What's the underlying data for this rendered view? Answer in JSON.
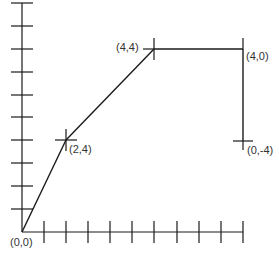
{
  "diagram": {
    "type": "coordinate path diagram",
    "axes": {
      "x_tick_count": 10,
      "y_tick_count": 10
    },
    "points": [
      {
        "label": "(0,0)",
        "role": "origin"
      },
      {
        "label": "(2,4)",
        "role": "vertex"
      },
      {
        "label": "(4,4)",
        "role": "vertex"
      },
      {
        "label": "(4,0)",
        "role": "vertex"
      },
      {
        "label": "(0,-4)",
        "role": "endpoint"
      }
    ],
    "path_order": [
      "(0,0)",
      "(2,4)",
      "(4,4)",
      "(4,0)",
      "(0,-4)"
    ],
    "line_color": "#1a1a1a",
    "label_color": "#333333"
  }
}
